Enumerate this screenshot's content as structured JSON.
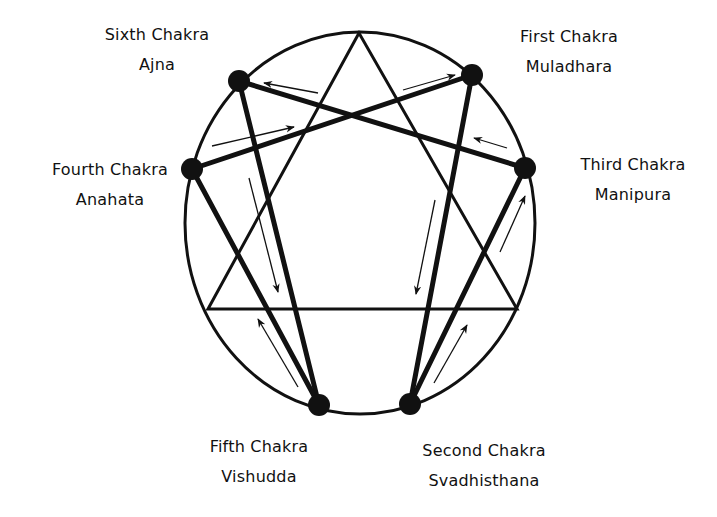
{
  "diagram": {
    "type": "enneagram-chakra",
    "colors": {
      "stroke": "#111111",
      "background": "#ffffff",
      "text": "#111111"
    },
    "ellipse": {
      "cx": 360,
      "cy": 223,
      "rx": 175,
      "ry": 191
    },
    "triangle": {
      "points": [
        [
          359,
          33
        ],
        [
          208,
          309
        ],
        [
          517,
          309
        ]
      ]
    },
    "nodes": [
      {
        "id": "sixth",
        "x": 239,
        "y": 81,
        "r": 11
      },
      {
        "id": "first",
        "x": 472,
        "y": 75,
        "r": 11
      },
      {
        "id": "fourth",
        "x": 192,
        "y": 169,
        "r": 11
      },
      {
        "id": "third",
        "x": 525,
        "y": 168,
        "r": 11
      },
      {
        "id": "fifth",
        "x": 319,
        "y": 405,
        "r": 11
      },
      {
        "id": "second",
        "x": 410,
        "y": 404,
        "r": 11
      }
    ],
    "connections": [
      [
        "fourth",
        "first"
      ],
      [
        "sixth",
        "third"
      ],
      [
        "sixth",
        "fifth"
      ],
      [
        "fourth",
        "fifth"
      ],
      [
        "first",
        "second"
      ],
      [
        "third",
        "second"
      ]
    ],
    "arrows": [
      {
        "from": [
          318,
          93
        ],
        "to": [
          264,
          83
        ]
      },
      {
        "from": [
          403,
          90
        ],
        "to": [
          455,
          75
        ]
      },
      {
        "from": [
          212,
          146
        ],
        "to": [
          294,
          127
        ]
      },
      {
        "from": [
          507,
          148
        ],
        "to": [
          474,
          138
        ]
      },
      {
        "from": [
          249,
          178
        ],
        "to": [
          278,
          292
        ]
      },
      {
        "from": [
          435,
          200
        ],
        "to": [
          416,
          294
        ]
      },
      {
        "from": [
          500,
          252
        ],
        "to": [
          525,
          196
        ]
      },
      {
        "from": [
          298,
          387
        ],
        "to": [
          258,
          319
        ]
      },
      {
        "from": [
          434,
          383
        ],
        "to": [
          467,
          325
        ]
      }
    ]
  },
  "labels": {
    "sixth": {
      "title": "Sixth Chakra",
      "name": "Ajna"
    },
    "first": {
      "title": "First Chakra",
      "name": "Muladhara"
    },
    "fourth": {
      "title": "Fourth Chakra",
      "name": "Anahata"
    },
    "third": {
      "title": "Third Chakra",
      "name": "Manipura"
    },
    "fifth": {
      "title": "Fifth Chakra",
      "name": "Vishudda"
    },
    "second": {
      "title": "Second Chakra",
      "name": "Svadhisthana"
    }
  }
}
